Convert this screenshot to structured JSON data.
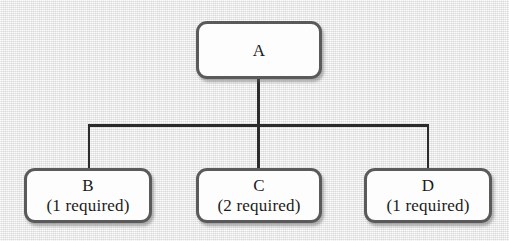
{
  "diagram": {
    "type": "tree",
    "title": "",
    "background_color": "#e9e9e9",
    "node_border_color": "#5a5a5a",
    "node_fill_color": "#fdfdfd",
    "connector_color": "#2b2b2b",
    "nodes": [
      {
        "id": "A",
        "label": "A",
        "sublabel": "",
        "level": 0
      },
      {
        "id": "B",
        "label": "B",
        "sublabel": "(1 required)",
        "level": 1
      },
      {
        "id": "C",
        "label": "C",
        "sublabel": "(2 required)",
        "level": 1
      },
      {
        "id": "D",
        "label": "D",
        "sublabel": "(1 required)",
        "level": 1
      }
    ],
    "edges": [
      {
        "from": "A",
        "to": "B"
      },
      {
        "from": "A",
        "to": "C"
      },
      {
        "from": "A",
        "to": "D"
      }
    ]
  }
}
